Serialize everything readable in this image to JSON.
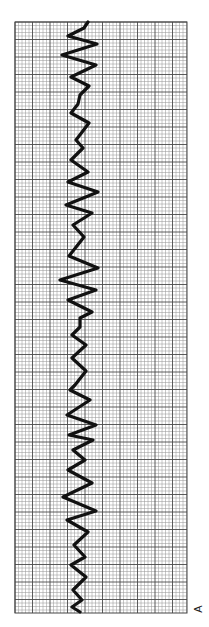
{
  "figure": {
    "panel_label": "A",
    "orientation": "rotated-90-clockwise"
  },
  "colors": {
    "background": "#ffffff",
    "grid_minor": "#9a9a9a",
    "grid_major": "#4a4a4a",
    "trace": "#111111"
  },
  "chart_data": {
    "type": "line",
    "title": "",
    "xlabel": "",
    "ylabel": "",
    "grid": true,
    "grid_box_px": {
      "x0": 15,
      "y0": 22,
      "x1": 187,
      "y1": 613
    },
    "minor_spacing_px": 3.5,
    "major_every_minor": 5,
    "trace_points_px": [
      [
        88,
        22
      ],
      [
        84,
        28
      ],
      [
        68,
        36
      ],
      [
        97,
        44
      ],
      [
        62,
        55
      ],
      [
        96,
        65
      ],
      [
        71,
        77
      ],
      [
        89,
        86
      ],
      [
        80,
        95
      ],
      [
        78,
        104
      ],
      [
        71,
        113
      ],
      [
        89,
        123
      ],
      [
        76,
        140
      ],
      [
        83,
        148
      ],
      [
        71,
        160
      ],
      [
        88,
        172
      ],
      [
        68,
        182
      ],
      [
        98,
        192
      ],
      [
        66,
        205
      ],
      [
        92,
        213
      ],
      [
        73,
        225
      ],
      [
        84,
        237
      ],
      [
        69,
        256
      ],
      [
        98,
        268
      ],
      [
        60,
        280
      ],
      [
        96,
        290
      ],
      [
        68,
        300
      ],
      [
        92,
        312
      ],
      [
        80,
        318
      ],
      [
        80,
        327
      ],
      [
        72,
        335
      ],
      [
        86,
        345
      ],
      [
        72,
        358
      ],
      [
        86,
        371
      ],
      [
        75,
        385
      ],
      [
        70,
        390
      ],
      [
        90,
        400
      ],
      [
        67,
        415
      ],
      [
        96,
        425
      ],
      [
        69,
        435
      ],
      [
        93,
        440
      ],
      [
        73,
        450
      ],
      [
        85,
        460
      ],
      [
        68,
        470
      ],
      [
        92,
        483
      ],
      [
        63,
        497
      ],
      [
        96,
        511
      ],
      [
        67,
        520
      ],
      [
        88,
        532
      ],
      [
        74,
        545
      ],
      [
        85,
        557
      ],
      [
        71,
        565
      ],
      [
        86,
        577
      ],
      [
        73,
        590
      ],
      [
        82,
        600
      ],
      [
        72,
        607
      ],
      [
        80,
        612
      ]
    ],
    "trace_width_px": 3.2
  }
}
